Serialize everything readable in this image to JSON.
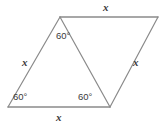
{
  "figure": {
    "kind": "geometry-diagram",
    "background_color": "#ffffff",
    "stroke_color": "#8a8a8a",
    "stroke_width": 1.2,
    "text_color": "#3a3a3a",
    "vertices": {
      "bottom_left": {
        "x": 8,
        "y": 107
      },
      "apex_top_left": {
        "x": 60,
        "y": 17
      },
      "top_right": {
        "x": 158,
        "y": 17
      },
      "bottom_right": {
        "x": 110,
        "y": 107
      }
    },
    "edges": [
      {
        "name": "top-edge",
        "from": "apex_top_left",
        "to": "top_right"
      },
      {
        "name": "right-edge",
        "from": "top_right",
        "to": "bottom_right"
      },
      {
        "name": "bottom-edge",
        "from": "bottom_right",
        "to": "bottom_left"
      },
      {
        "name": "left-edge",
        "from": "bottom_left",
        "to": "apex_top_left"
      },
      {
        "name": "diagonal-edge",
        "from": "apex_top_left",
        "to": "bottom_right"
      }
    ],
    "side_labels": [
      {
        "name": "side-label-top",
        "text": "x"
      },
      {
        "name": "side-label-right",
        "text": "x"
      },
      {
        "name": "side-label-bottom",
        "text": "x"
      },
      {
        "name": "side-label-left",
        "text": "x"
      }
    ],
    "angle_labels": [
      {
        "name": "angle-label-apex",
        "text": "60°"
      },
      {
        "name": "angle-label-bottom-left",
        "text": "60°"
      },
      {
        "name": "angle-label-bottom-right",
        "text": "60°"
      }
    ]
  }
}
